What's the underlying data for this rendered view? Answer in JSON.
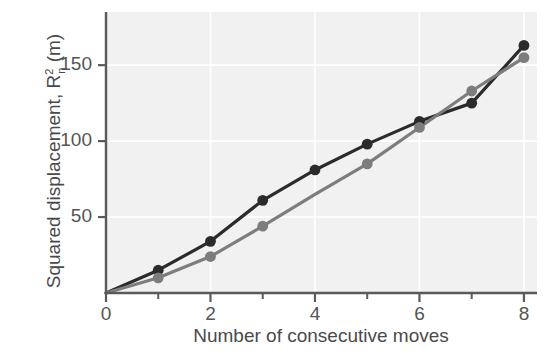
{
  "chart_data": {
    "type": "line",
    "title": "",
    "xlabel": "Number of consecutive moves",
    "ylabel_text": "Squared displacement, R",
    "ylabel_sup": "2",
    "ylabel_sub": "n",
    "ylabel_unit": " (m)",
    "ylabel_full": "Squared displacement, R²n (m)",
    "x": [
      0,
      1,
      2,
      3,
      4,
      5,
      6,
      7,
      8
    ],
    "xlim": [
      0,
      8.25
    ],
    "ylim": [
      0,
      185
    ],
    "xticks": [
      0,
      2,
      4,
      6,
      8
    ],
    "xtick_labels": [
      "0",
      "2",
      "4",
      "6",
      "8"
    ],
    "xminorticks": [
      1,
      3,
      5,
      7
    ],
    "yticks": [
      50,
      100,
      150
    ],
    "ytick_labels": [
      "50",
      "100",
      "150"
    ],
    "grid": true,
    "grid_color": "#ffffff",
    "plot_bg": "#f1f1f1",
    "legend": "none",
    "series": [
      {
        "name": "dark",
        "color": "#2b2b2b",
        "marker": "circle",
        "x": [
          0,
          1,
          2,
          3,
          4,
          5,
          6,
          7,
          8
        ],
        "values": [
          0,
          15,
          34,
          61,
          81,
          98,
          113,
          125,
          163
        ],
        "marker_x": [
          1,
          2,
          3,
          4,
          5,
          6,
          7,
          8
        ],
        "marker_values": [
          15,
          34,
          61,
          81,
          98,
          113,
          125,
          163
        ]
      },
      {
        "name": "gray",
        "color": "#7d7d7d",
        "marker": "circle",
        "x": [
          0,
          1,
          2,
          3,
          4,
          5,
          6,
          7,
          8
        ],
        "values": [
          0,
          10,
          24,
          44,
          65,
          85,
          109,
          133,
          155
        ],
        "marker_x": [
          1,
          2,
          3,
          5,
          6,
          7,
          8
        ],
        "marker_values": [
          10,
          24,
          44,
          85,
          109,
          133,
          155
        ]
      }
    ]
  },
  "axis": {
    "axis_color": "#5a5a5a",
    "tick_color": "#5a5a5a"
  }
}
